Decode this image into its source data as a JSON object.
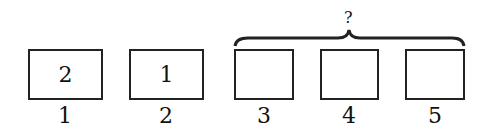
{
  "diagram": {
    "question_mark": "?",
    "boxes": [
      {
        "position": "1",
        "content": "2"
      },
      {
        "position": "2",
        "content": "1"
      },
      {
        "position": "3",
        "content": ""
      },
      {
        "position": "4",
        "content": ""
      },
      {
        "position": "5",
        "content": ""
      }
    ],
    "brace_spans": [
      "3",
      "4",
      "5"
    ]
  }
}
